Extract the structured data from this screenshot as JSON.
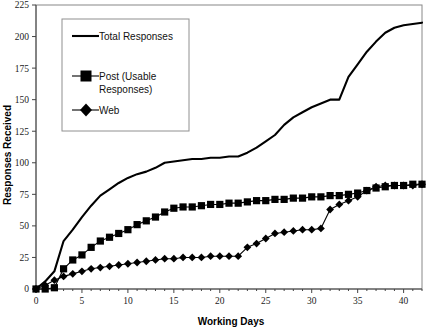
{
  "chart_data": {
    "type": "line",
    "title": "",
    "xlabel": "Working Days",
    "ylabel": "Responses Received",
    "xlim": [
      0,
      42
    ],
    "ylim": [
      0,
      225
    ],
    "xticks": [
      0,
      5,
      10,
      15,
      20,
      25,
      30,
      35,
      40
    ],
    "yticks": [
      0,
      25,
      50,
      75,
      100,
      125,
      150,
      175,
      200,
      225
    ],
    "grid": false,
    "legend_position": "upper-left-inset",
    "colors": {
      "line": "#000000",
      "frame": "#888888",
      "background": "#ffffff"
    },
    "x": [
      0,
      1,
      2,
      3,
      4,
      5,
      6,
      7,
      8,
      9,
      10,
      11,
      12,
      13,
      14,
      15,
      16,
      17,
      18,
      19,
      20,
      21,
      22,
      23,
      24,
      25,
      26,
      27,
      28,
      29,
      30,
      31,
      32,
      33,
      34,
      35,
      36,
      37,
      38,
      39,
      40,
      41,
      42
    ],
    "series": [
      {
        "name": "Total Responses",
        "marker": "none",
        "values": [
          0,
          6,
          14,
          38,
          47,
          57,
          66,
          74,
          79,
          84,
          88,
          91,
          93,
          96,
          100,
          101,
          102,
          103,
          103,
          104,
          104,
          105,
          105,
          108,
          112,
          117,
          122,
          130,
          136,
          140,
          144,
          147,
          150,
          150,
          168,
          178,
          188,
          196,
          203,
          207,
          209,
          210,
          211
        ]
      },
      {
        "name": "Post (Usable Responses)",
        "marker": "square",
        "values": [
          0,
          0,
          1,
          16,
          23,
          27,
          33,
          38,
          41,
          44,
          47,
          51,
          54,
          57,
          61,
          64,
          65,
          65,
          66,
          67,
          67,
          68,
          68,
          69,
          70,
          70,
          71,
          71,
          72,
          72,
          73,
          73,
          74,
          74,
          75,
          76,
          78,
          80,
          81,
          82,
          82,
          83,
          83
        ]
      },
      {
        "name": "Web",
        "marker": "diamond",
        "values": [
          0,
          3,
          7,
          10,
          12,
          14,
          16,
          17,
          18,
          19,
          20,
          21,
          22,
          23,
          24,
          24,
          25,
          25,
          25,
          26,
          26,
          26,
          26,
          33,
          36,
          40,
          44,
          45,
          46,
          47,
          47,
          48,
          63,
          67,
          70,
          73,
          78,
          81,
          82,
          82,
          82,
          82,
          83
        ]
      }
    ]
  },
  "legend": {
    "items": [
      {
        "label": "Total Responses",
        "marker": "none"
      },
      {
        "label": "Post (Usable",
        "label2": "Responses)",
        "marker": "square"
      },
      {
        "label": "Web",
        "marker": "diamond"
      }
    ]
  },
  "axis": {
    "x_title": "Working Days",
    "y_title": "Responses Received",
    "x_tick_labels": [
      "0",
      "5",
      "10",
      "15",
      "20",
      "25",
      "30",
      "35",
      "40"
    ],
    "y_tick_labels": [
      "0",
      "25",
      "50",
      "75",
      "100",
      "125",
      "150",
      "175",
      "200",
      "225"
    ]
  }
}
